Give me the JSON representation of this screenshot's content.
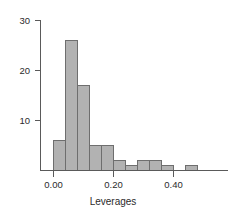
{
  "chart_data": {
    "type": "bar",
    "title": "",
    "subtitle": "",
    "xlabel": "Leverages",
    "ylabel": "",
    "bin_width": 0.04,
    "bin_starts": [
      0.0,
      0.04,
      0.08,
      0.12,
      0.16,
      0.2,
      0.24,
      0.28,
      0.32,
      0.36,
      0.4,
      0.44
    ],
    "bin_ends": [
      0.04,
      0.08,
      0.12,
      0.16,
      0.2,
      0.24,
      0.28,
      0.32,
      0.36,
      0.4,
      0.44,
      0.48
    ],
    "categories": [
      "0.00-0.04",
      "0.04-0.08",
      "0.08-0.12",
      "0.12-0.16",
      "0.16-0.20",
      "0.20-0.24",
      "0.24-0.28",
      "0.28-0.32",
      "0.32-0.36",
      "0.36-0.40",
      "0.40-0.44",
      "0.44-0.48"
    ],
    "values": [
      6,
      26,
      17,
      5,
      5,
      2,
      1,
      2,
      2,
      1,
      0,
      1
    ],
    "xlim": [
      -0.025,
      0.56
    ],
    "ylim": [
      0,
      31
    ],
    "x_ticks": [
      0.0,
      0.2,
      0.4
    ],
    "x_tick_labels": [
      "0.00",
      "0.20",
      "0.40"
    ],
    "y_ticks": [
      10,
      20,
      30
    ],
    "y_tick_labels": [
      "10",
      "20",
      "30"
    ],
    "grid": false,
    "legend": false,
    "bar_fill_color": "#b2b2b2",
    "bar_border_color": "#6e6e6e",
    "axis_color": "#5a5a5a",
    "text_color": "#2b2b2b",
    "background_color": "#ffffff"
  }
}
